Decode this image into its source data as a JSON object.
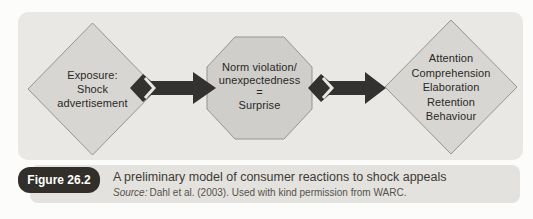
{
  "figure": {
    "badge_label": "Figure 26.2",
    "caption": "A preliminary model of consumer reactions to shock appeals",
    "source_prefix": "Source:",
    "source_text": "Dahl et al. (2003). Used with kind permission from WARC."
  },
  "diagram": {
    "nodes": [
      {
        "id": "exposure",
        "shape": "diamond",
        "lines": [
          "Exposure:",
          "Shock",
          "advertisement"
        ]
      },
      {
        "id": "norm-violation",
        "shape": "octagon",
        "lines": [
          "Norm violation/",
          "unexpectedness",
          "=",
          "Surprise"
        ]
      },
      {
        "id": "reactions",
        "shape": "diamond",
        "lines": [
          "Attention",
          "Comprehension",
          "Elaboration",
          "Retention",
          "Behaviour"
        ]
      }
    ],
    "connectors": [
      {
        "from": "exposure",
        "to": "norm-violation",
        "style": "block-arrow"
      },
      {
        "from": "norm-violation",
        "to": "reactions",
        "style": "block-arrow"
      }
    ]
  },
  "colors": {
    "page_bg": "#fcfcfb",
    "panel_bg": "#e9e8e5",
    "caption_bg": "#e3e2de",
    "diamond_fill": "#d7d6d2",
    "octagon_fill": "#cfcecb",
    "node_stroke": "#96948e",
    "arrow_fill": "#343230",
    "badge_bg": "#322f2b",
    "badge_text": "#ffffff"
  }
}
